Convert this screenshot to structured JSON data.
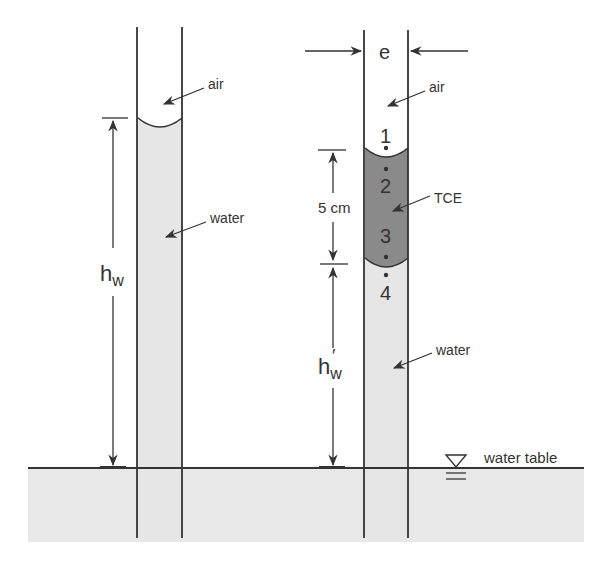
{
  "diagram": {
    "left_tube": {
      "labels": {
        "air": "air",
        "water": "water"
      },
      "dimension": {
        "symbol": "h",
        "subscript": "w"
      }
    },
    "right_tube": {
      "width_label": "e",
      "labels": {
        "air": "air",
        "tce": "TCE",
        "water": "water"
      },
      "points": [
        "1",
        "2",
        "3",
        "4"
      ],
      "tce_thickness": "5 cm",
      "dimension": {
        "symbol": "h",
        "prime": "′",
        "subscript": "w"
      }
    },
    "water_table_label": "water table",
    "colors": {
      "line": "#333333",
      "water_fill": "#e6e6e6",
      "tce_fill": "#8a8a8a",
      "ground_fill": "#e8e8e8",
      "background": "#ffffff"
    }
  }
}
